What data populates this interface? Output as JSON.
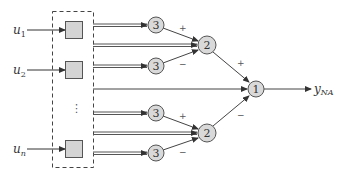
{
  "diagram": {
    "inputs": [
      {
        "label": "u",
        "sub": "1",
        "y": 30
      },
      {
        "label": "u",
        "sub": "2",
        "y": 70
      },
      {
        "label": "u",
        "sub": "n",
        "y": 149
      }
    ],
    "ellipsis": "⋮",
    "layer3_nodes": [
      {
        "label": "3",
        "cx": 156,
        "cy": 25
      },
      {
        "label": "3",
        "cx": 156,
        "cy": 66
      },
      {
        "label": "3",
        "cx": 156,
        "cy": 113
      },
      {
        "label": "3",
        "cx": 156,
        "cy": 153
      }
    ],
    "layer2_nodes": [
      {
        "label": "2",
        "cx": 207,
        "cy": 45
      },
      {
        "label": "2",
        "cx": 207,
        "cy": 133
      }
    ],
    "layer1_node": {
      "label": "1",
      "cx": 256,
      "cy": 89
    },
    "signs": {
      "top_plus": "+",
      "top_minus": "−",
      "bottom_plus": "+",
      "bottom_minus": "−",
      "out_plus": "+",
      "out_minus": "−"
    },
    "output": {
      "label": "y",
      "sub": "NA"
    },
    "colors": {
      "node_fill": "#d9d9d9",
      "node_stroke": "#555555",
      "line": "#444444",
      "box_fill": "#d4d4d4"
    }
  }
}
